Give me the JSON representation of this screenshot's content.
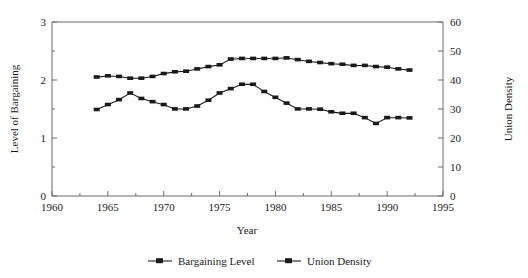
{
  "chart_data": {
    "type": "line",
    "title": "",
    "xlabel": "Year",
    "ylabel": "Level of Bargaining",
    "y2label": "Union Density",
    "xlim": [
      1960,
      1995
    ],
    "ylim": [
      0,
      3
    ],
    "y2lim": [
      0,
      60
    ],
    "xticks": [
      1960,
      1965,
      1970,
      1975,
      1980,
      1985,
      1990,
      1995
    ],
    "xtick_labels": [
      "1960",
      "1965",
      "1970",
      "1975",
      "1980",
      "1985",
      "1990",
      "1995"
    ],
    "xminor_ticks": [
      1962.5,
      1967.5,
      1972.5,
      1977.5,
      1982.5,
      1987.5,
      1992.5
    ],
    "yticks": [
      0,
      1,
      2,
      3
    ],
    "ytick_labels": [
      "0",
      "1",
      "2",
      "3"
    ],
    "yminor_ticks": [
      0.5,
      1.5,
      2.5
    ],
    "y2ticks": [
      0,
      10,
      20,
      30,
      40,
      50,
      60
    ],
    "y2tick_labels": [
      "0",
      "10",
      "20",
      "30",
      "40",
      "50",
      "60"
    ],
    "grid": false,
    "legend_position": "bottom-center",
    "x": [
      1964,
      1965,
      1966,
      1967,
      1968,
      1969,
      1970,
      1971,
      1972,
      1973,
      1974,
      1975,
      1976,
      1977,
      1978,
      1979,
      1980,
      1981,
      1982,
      1983,
      1984,
      1985,
      1986,
      1987,
      1988,
      1989,
      1990,
      1991,
      1992
    ],
    "series": [
      {
        "name": "Bargaining Level",
        "axis": "left",
        "values": [
          2.05,
          2.07,
          2.06,
          2.03,
          2.03,
          2.06,
          2.11,
          2.14,
          2.15,
          2.19,
          2.23,
          2.26,
          2.36,
          2.37,
          2.37,
          2.37,
          2.37,
          2.38,
          2.35,
          2.32,
          2.3,
          2.28,
          2.27,
          2.25,
          2.25,
          2.23,
          2.22,
          2.19,
          2.17
        ],
        "dashed_segment_years": [
          1976,
          1977,
          1978,
          1979,
          1980,
          1981
        ]
      },
      {
        "name": "Union Density",
        "axis": "right",
        "values": [
          29.8,
          31.5,
          33.2,
          35.5,
          33.6,
          32.5,
          31.5,
          30.0,
          30.0,
          31.0,
          33.0,
          35.5,
          37.0,
          38.5,
          38.5,
          36.0,
          34.0,
          32.0,
          30.0,
          30.0,
          29.9,
          29.0,
          28.5,
          28.5,
          27.0,
          25.0,
          27.0,
          27.0,
          26.9
        ]
      }
    ],
    "legend": [
      {
        "label": "Bargaining Level"
      },
      {
        "label": "Union Density"
      }
    ]
  },
  "colors": {
    "axis": "#6b6b6b",
    "line": "#1a1a1a",
    "dashed": "#8d8d8d",
    "background": "#ffffff"
  }
}
